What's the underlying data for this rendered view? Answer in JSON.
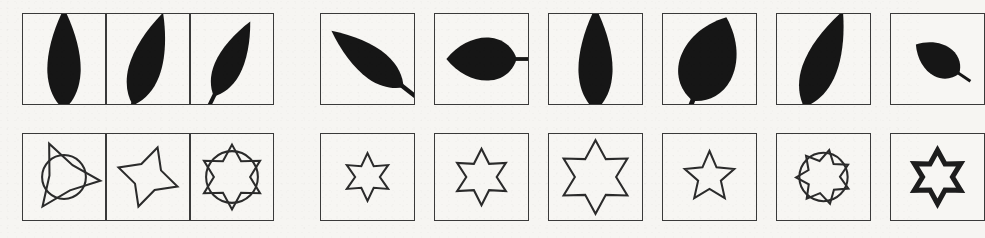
{
  "page": {
    "background_color": "#f6f5f2",
    "stroke_color": "#2b2b2b",
    "fill_color": "#161616",
    "width": 919,
    "height": 238
  },
  "layout": {
    "rows": [
      {
        "name": "leaf-row",
        "top": 13,
        "cell_height": 92
      },
      {
        "name": "star-row",
        "top": 133,
        "cell_height": 88
      }
    ],
    "left_group": {
      "left": 22,
      "cell_width": 84,
      "cell_count": 3,
      "contiguous": true
    },
    "right_group": {
      "left": 320,
      "cell_width": 95,
      "gap": 19,
      "cell_count": 6,
      "contiguous": false
    }
  },
  "rows": [
    {
      "name": "leaf-row",
      "category": "leaf",
      "left_group": {
        "name": "leaf-query-group",
        "cells": [
          {
            "name": "leaf-upright-narrow",
            "shape": "leaf",
            "variant": "lanceolate",
            "rotation": 0,
            "scale": 1.0,
            "stem": true,
            "label": "upright narrow leaf"
          },
          {
            "name": "leaf-tilted-narrow",
            "shape": "leaf",
            "variant": "lanceolate",
            "rotation": 18,
            "scale": 0.96,
            "stem": true,
            "label": "tilted narrow leaf"
          },
          {
            "name": "leaf-tilted-small",
            "shape": "leaf",
            "variant": "lanceolate",
            "rotation": 26,
            "scale": 0.82,
            "stem": true,
            "label": "small tilted leaf"
          }
        ]
      },
      "right_group": {
        "name": "leaf-candidate-group",
        "cells": [
          {
            "name": "leaf-diagonal-up",
            "shape": "leaf",
            "variant": "lanceolate",
            "rotation": -52,
            "scale": 0.9,
            "stem": true,
            "label": "diagonal leaf pointing up-right"
          },
          {
            "name": "leaf-horizontal",
            "shape": "leaf",
            "variant": "ovate",
            "rotation": -90,
            "scale": 0.78,
            "stem": true,
            "label": "horizontal leaf"
          },
          {
            "name": "leaf-upright-tall",
            "shape": "leaf",
            "variant": "lanceolate",
            "rotation": 0,
            "scale": 1.02,
            "stem": true,
            "label": "upright tall leaf"
          },
          {
            "name": "leaf-broad-ovate",
            "shape": "leaf",
            "variant": "ovate",
            "rotation": 22,
            "scale": 1.0,
            "stem": true,
            "label": "broad ovate leaf"
          },
          {
            "name": "leaf-diagonal-down",
            "shape": "leaf",
            "variant": "lanceolate",
            "rotation": 22,
            "scale": 1.02,
            "stem": true,
            "label": "diagonal leaf pointing down-right"
          },
          {
            "name": "leaf-small-tilted",
            "shape": "leaf",
            "variant": "ovate",
            "rotation": -56,
            "scale": 0.58,
            "stem": true,
            "label": "small tilted leaf"
          }
        ]
      }
    },
    {
      "name": "star-row",
      "category": "star",
      "left_group": {
        "name": "star-query-group",
        "cells": [
          {
            "name": "star-3-point-with-circle",
            "shape": "star",
            "points": 3,
            "inner_ratio": 0.4,
            "rotation": 96,
            "scale": 1.06,
            "circle": true,
            "circle_r": 0.3,
            "bold": false,
            "label": "three-pointed star with circle"
          },
          {
            "name": "star-4-point",
            "shape": "star",
            "points": 4,
            "inner_ratio": 0.47,
            "rotation": 18,
            "scale": 0.9,
            "circle": false,
            "circle_r": 0,
            "bold": false,
            "label": "four-pointed star"
          },
          {
            "name": "star-6-point-with-circle",
            "shape": "star",
            "points": 6,
            "inner_ratio": 0.56,
            "rotation": 0,
            "scale": 0.94,
            "circle": true,
            "circle_r": 0.4,
            "bold": false,
            "label": "six-pointed star with circle"
          }
        ]
      },
      "right_group": {
        "name": "star-candidate-group",
        "cells": [
          {
            "name": "star-6-point-small",
            "shape": "star",
            "points": 6,
            "inner_ratio": 0.52,
            "rotation": 0,
            "scale": 0.66,
            "circle": false,
            "circle_r": 0,
            "bold": false,
            "label": "small six-pointed star"
          },
          {
            "name": "star-6-point-medium",
            "shape": "star",
            "points": 6,
            "inner_ratio": 0.54,
            "rotation": 0,
            "scale": 0.78,
            "circle": false,
            "circle_r": 0,
            "bold": false,
            "label": "medium six-pointed star"
          },
          {
            "name": "star-6-point-large",
            "shape": "star",
            "points": 6,
            "inner_ratio": 0.56,
            "rotation": 0,
            "scale": 1.02,
            "circle": false,
            "circle_r": 0,
            "bold": false,
            "label": "large six-pointed star"
          },
          {
            "name": "star-5-point",
            "shape": "star",
            "points": 5,
            "inner_ratio": 0.46,
            "rotation": 0,
            "scale": 0.72,
            "circle": false,
            "circle_r": 0,
            "bold": false,
            "label": "five-pointed star"
          },
          {
            "name": "star-7-point-with-circle",
            "shape": "star",
            "points": 7,
            "inner_ratio": 0.6,
            "rotation": 12,
            "scale": 0.76,
            "circle": true,
            "circle_r": 0.44,
            "bold": false,
            "label": "seven-pointed star with circle"
          },
          {
            "name": "star-6-point-bold",
            "shape": "star",
            "points": 6,
            "inner_ratio": 0.56,
            "rotation": 0,
            "scale": 0.74,
            "circle": false,
            "circle_r": 0,
            "bold": true,
            "label": "bold six-pointed star"
          }
        ]
      }
    }
  ]
}
